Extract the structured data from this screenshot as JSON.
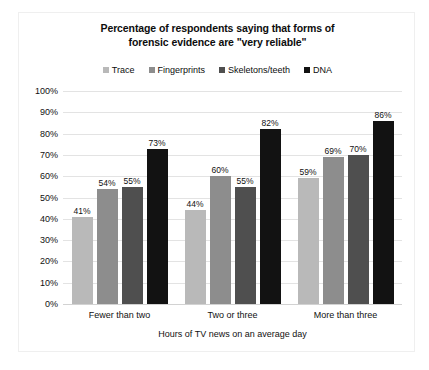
{
  "chart_data": {
    "type": "bar",
    "title": "Percentage of respondents saying that forms of forensic evidence are \"very reliable\"",
    "title_line1": "Percentage of respondents saying that forms of",
    "title_line2": "forensic evidence are \"very reliable\"",
    "xlabel": "Hours of TV news on an average day",
    "ylabel": "",
    "categories": [
      "Fewer than two",
      "Two or three",
      "More than three"
    ],
    "series": [
      {
        "name": "Trace",
        "color": "#b9b9b9",
        "values": [
          41,
          54,
          59
        ]
      },
      {
        "name": "Fingerprints",
        "color": "#8d8d8d",
        "values": [
          54,
          60,
          69
        ]
      },
      {
        "name": "Skeletons/teeth",
        "color": "#4f4f4f",
        "values": [
          55,
          55,
          70
        ]
      },
      {
        "name": "DNA",
        "color": "#121212",
        "values": [
          73,
          82,
          86
        ]
      }
    ],
    "value_labels": [
      [
        "41%",
        "54%",
        "55%",
        "73%"
      ],
      [
        "44%",
        "60%",
        "55%",
        "82%"
      ],
      [
        "59%",
        "69%",
        "70%",
        "86%"
      ]
    ],
    "group_values": [
      [
        41,
        54,
        55,
        73
      ],
      [
        44,
        60,
        55,
        82
      ],
      [
        59,
        69,
        70,
        86
      ]
    ],
    "ylim": [
      0,
      100
    ],
    "ytick_values": [
      100,
      90,
      80,
      70,
      60,
      50,
      40,
      30,
      20,
      10,
      0
    ],
    "yticks": [
      "100%",
      "90%",
      "80%",
      "70%",
      "60%",
      "50%",
      "40%",
      "30%",
      "20%",
      "10%",
      "0%"
    ],
    "grid": true,
    "legend_position": "top-center",
    "plot_background": "#ffffff",
    "gridline_color": "#e3e3e3",
    "frame_color": "#efefef"
  }
}
